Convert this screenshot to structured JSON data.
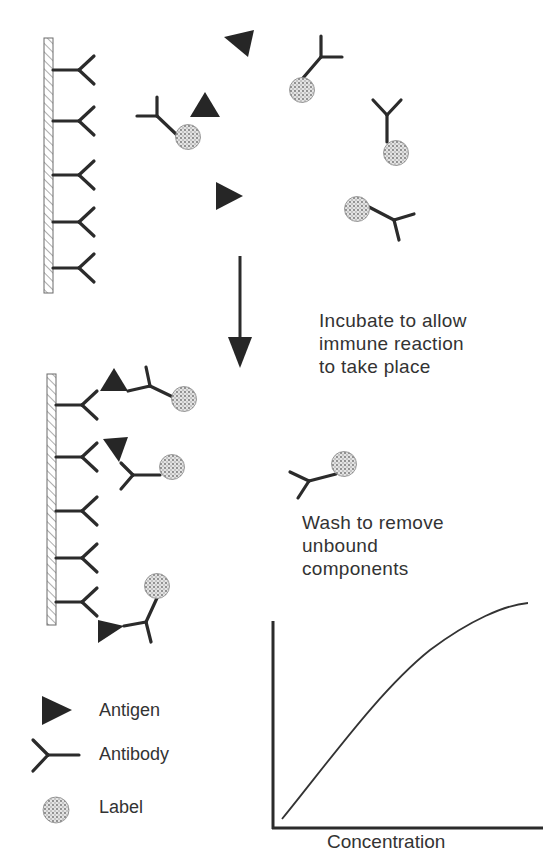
{
  "steps": {
    "incubate": [
      "Incubate to allow",
      "immune reaction",
      "to take place"
    ],
    "wash": [
      "Wash to remove",
      "unbound",
      "components"
    ]
  },
  "legend": {
    "items": [
      {
        "symbol": "antigen-triangle",
        "label": "Antigen"
      },
      {
        "symbol": "antibody-y",
        "label": "Antibody"
      },
      {
        "symbol": "label-dotted-circle",
        "label": "Label"
      }
    ]
  },
  "graph": {
    "xlabel": "Concentration",
    "ylabel": ""
  },
  "colors": {
    "ink": "#2b2b2b",
    "label_fill": "#c9c9c9",
    "surface_hatch": "#8a8a8a"
  }
}
